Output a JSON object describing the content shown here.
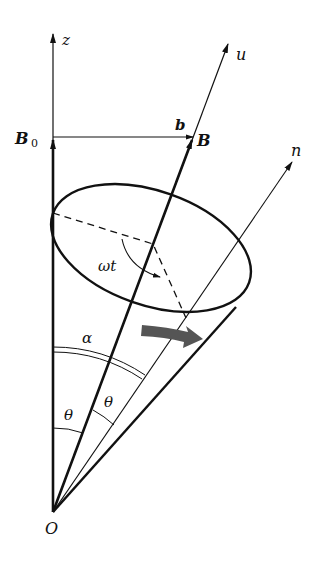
{
  "diagram": {
    "type": "vector-precession-cone",
    "labels": {
      "z_axis": "z",
      "u_axis": "u",
      "n_axis": "n",
      "B0": "B",
      "B0_sub": "0",
      "b": "b",
      "B": "B",
      "omega_t": "ωt",
      "alpha": "α",
      "theta1": "θ",
      "theta2": "θ",
      "origin": "O"
    },
    "colors": {
      "line": "#111111",
      "rotation_arrow": "#555555",
      "background": "#ffffff"
    }
  }
}
